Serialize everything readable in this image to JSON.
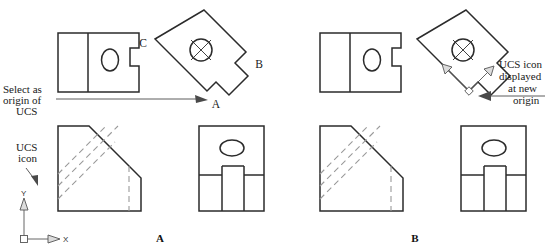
{
  "figure": {
    "background_color": "#ffffff",
    "line_color": "#2b2b2b",
    "hidden_line_color": "#9a9a9a",
    "leader_color": "#4a4a4a"
  },
  "annotations": {
    "select_origin": {
      "line1": "Select as",
      "line2": "origin of",
      "line3": "UCS"
    },
    "ucs_icon_label": {
      "line1": "UCS",
      "line2": "icon"
    },
    "ucs_new_origin": {
      "line1": "UCS icon",
      "line2": "displayed",
      "line3": "at new",
      "line4": "origin"
    }
  },
  "point_labels": {
    "a": "A",
    "b": "B",
    "c": "C"
  },
  "axis_labels": {
    "x": "X",
    "y": "Y"
  },
  "captions": {
    "left": "A",
    "right": "B"
  }
}
